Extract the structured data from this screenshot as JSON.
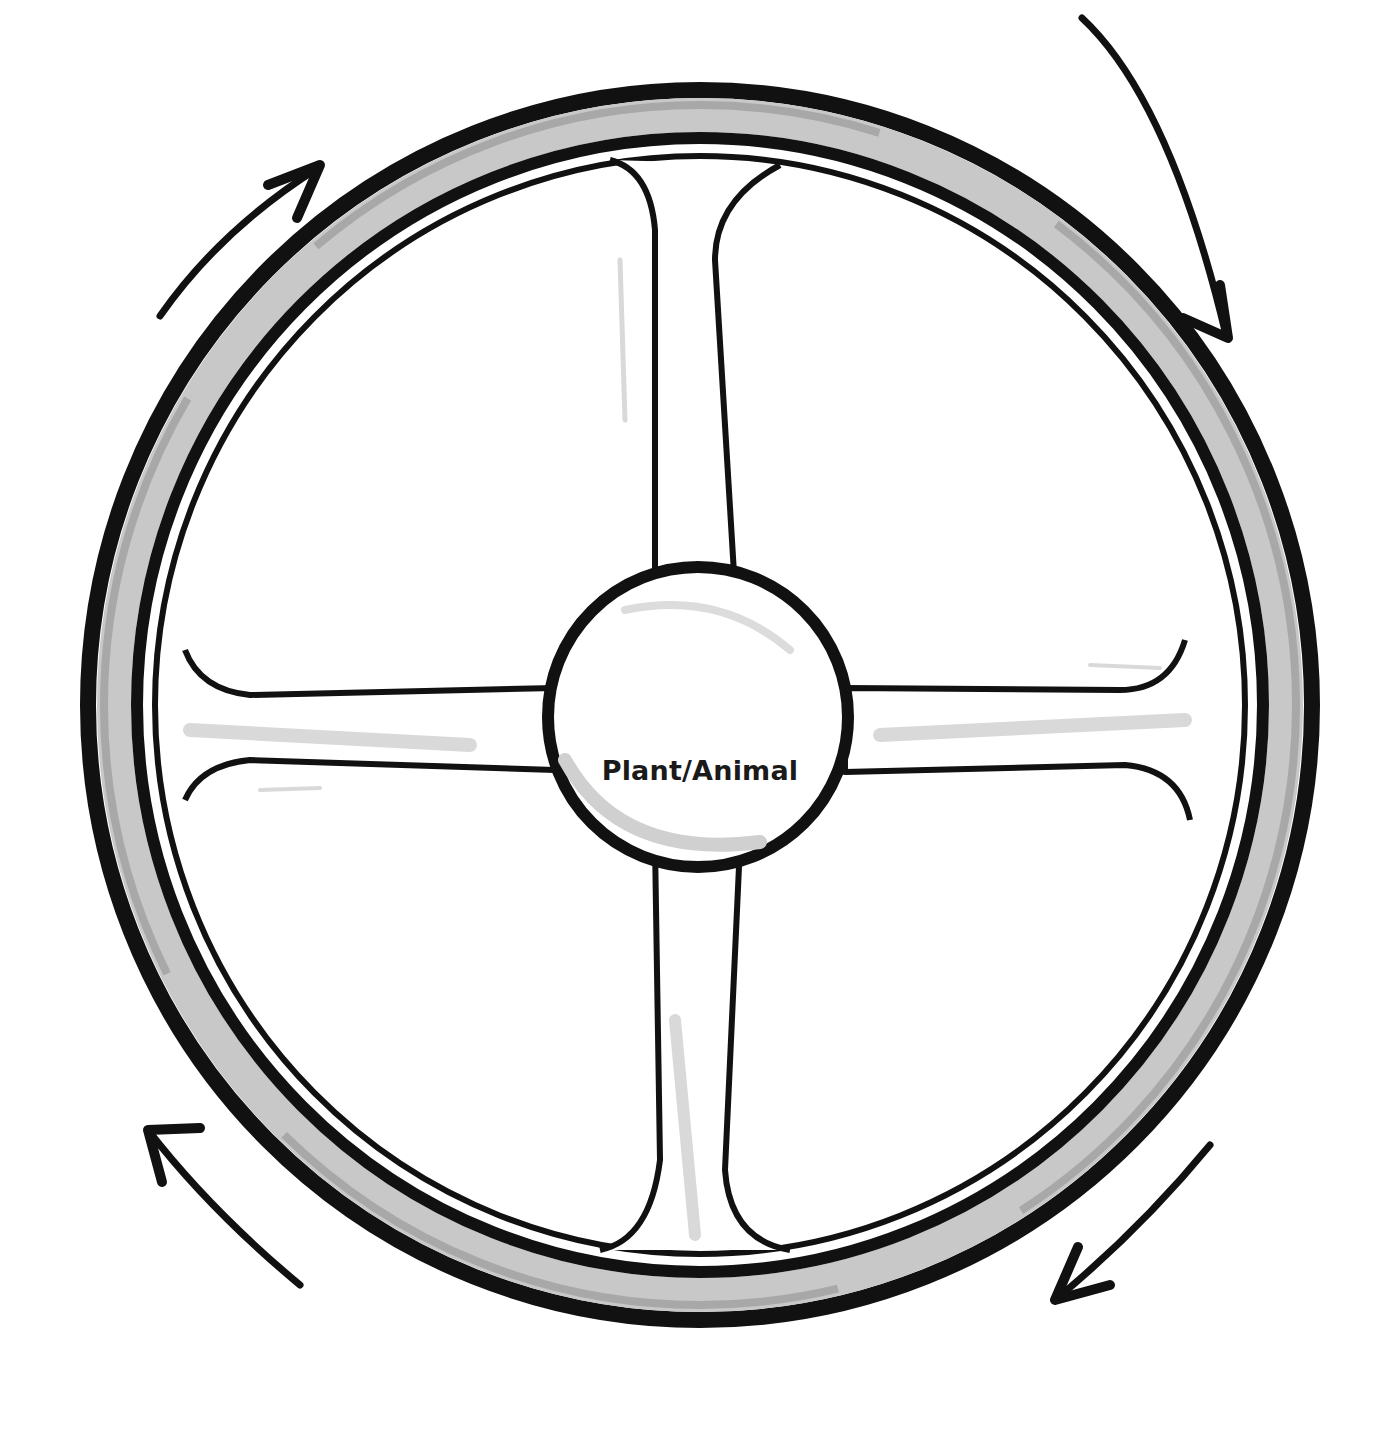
{
  "diagram": {
    "type": "cycle-wheel",
    "center_label": "Plant/Animal",
    "spokes": 4,
    "arrows": [
      {
        "position": "top-left",
        "direction": "clockwise"
      },
      {
        "position": "top-right",
        "direction": "clockwise"
      },
      {
        "position": "bottom-right",
        "direction": "clockwise"
      },
      {
        "position": "bottom-left",
        "direction": "clockwise"
      }
    ],
    "colors": {
      "ink": "#111111",
      "rim_gray": "#c8c8c8",
      "rim_dark_gray": "#a8a8a8",
      "highlight_gray": "#d9d9d9",
      "background": "#ffffff"
    }
  }
}
